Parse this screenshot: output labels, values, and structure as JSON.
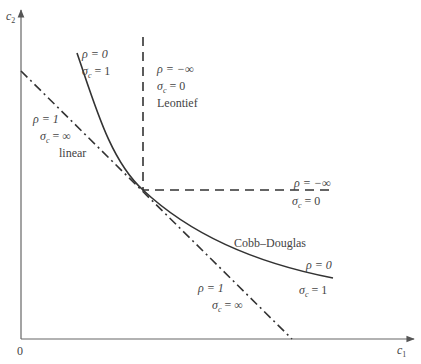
{
  "diagram": {
    "axes": {
      "x_label": "c",
      "x_sub": "1",
      "y_label": "c",
      "y_sub": "2",
      "origin": "0"
    },
    "curves": [
      {
        "name": "Leontief",
        "style": "dashed",
        "rho": "ρ = −∞",
        "sigma": "σ",
        "sigma_sub": "c",
        "sigma_val": " = 0",
        "tag": "Leontief"
      },
      {
        "name": "Cobb–Douglas",
        "style": "solid",
        "rho": "ρ = 0",
        "sigma": "σ",
        "sigma_sub": "c",
        "sigma_val": " = 1",
        "tag": "Cobb–Douglas"
      },
      {
        "name": "linear",
        "style": "dash-dot",
        "rho": "ρ = 1",
        "sigma": "σ",
        "sigma_sub": "c",
        "sigma_val": " = ∞",
        "tag": "linear"
      }
    ],
    "labels": {
      "cd_top_rho": "ρ = 0",
      "cd_top_sigma": "σ",
      "cd_top_sub": "c",
      "cd_top_val": " = 1",
      "leo_top_rho": "ρ = −∞",
      "leo_top_sigma": "σ",
      "leo_top_sub": "c",
      "leo_top_val": " = 0",
      "leo_top_tag": "Leontief",
      "lin_left_rho": "ρ = 1",
      "lin_left_sigma": "σ",
      "lin_left_sub": "c",
      "lin_left_val": " = ∞",
      "lin_left_tag": "linear",
      "leo_right_rho": "ρ = −∞",
      "leo_right_sigma": "σ",
      "leo_right_sub": "c",
      "leo_right_val": " = 0",
      "cd_tag": "Cobb–Douglas",
      "cd_right_rho": "ρ = 0",
      "cd_right_sigma": "σ",
      "cd_right_sub": "c",
      "cd_right_val": " = 1",
      "lin_bottom_rho": "ρ = 1",
      "lin_bottom_sigma": "σ",
      "lin_bottom_sub": "c",
      "lin_bottom_val": " = ∞"
    }
  }
}
